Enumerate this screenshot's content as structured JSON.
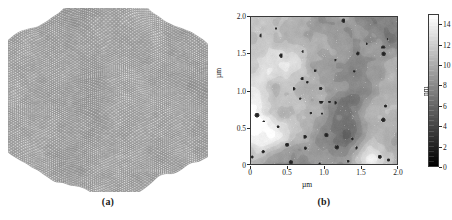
{
  "figure": {
    "panels": [
      {
        "id": "a",
        "caption": "(a)",
        "kind": "3d-surface-render",
        "description": "Three-dimensional AFM surface topography rendering with granular mesh texture"
      },
      {
        "id": "b",
        "caption": "(b)",
        "kind": "2d-height-map",
        "description": "Two-dimensional AFM grayscale height map with scale bar"
      }
    ]
  },
  "chart_data": [
    {
      "type": "heatmap",
      "panel": "a",
      "title": "",
      "render": "3d-surface",
      "xlabel": "",
      "ylabel": "",
      "grid": false,
      "legend": "none",
      "colormap": "grayscale",
      "texture": "granular",
      "axes_visible": false
    },
    {
      "type": "heatmap",
      "panel": "b",
      "title": "",
      "xlabel": "µm",
      "ylabel": "µm",
      "xlim": [
        0,
        2.0
      ],
      "ylim": [
        0,
        2.0
      ],
      "xticks": [
        0,
        0.5,
        1.0,
        1.5,
        2.0
      ],
      "yticks": [
        0,
        0.5,
        1.0,
        1.5,
        2.0
      ],
      "xticklabels": [
        "0",
        "0.5",
        "1.0",
        "1.5",
        "2.0"
      ],
      "yticklabels": [
        "0",
        "0.5",
        "1.0",
        "1.5",
        "2.0"
      ],
      "grid": false,
      "legend": "colorbar-right",
      "colormap": "grayscale",
      "colorbar": {
        "label": "nm",
        "vmin": 0,
        "vmax": 15,
        "ticks": [
          0,
          2,
          4,
          6,
          8,
          10,
          12,
          14
        ],
        "ticklabels": [
          "0",
          "2",
          "4",
          "6",
          "8",
          "10",
          "12",
          "14"
        ],
        "low_color": "#000000",
        "high_color": "#ffffff",
        "orientation": "vertical"
      }
    }
  ]
}
